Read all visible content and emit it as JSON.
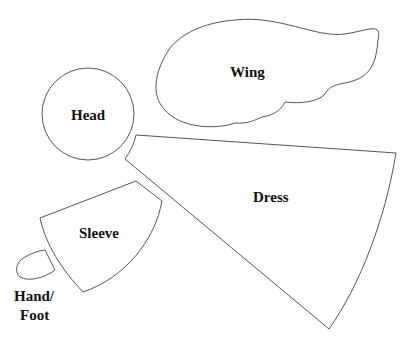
{
  "pieces": {
    "wing": {
      "label": "Wing"
    },
    "head": {
      "label": "Head"
    },
    "dress": {
      "label": "Dress"
    },
    "sleeve": {
      "label": "Sleeve"
    },
    "hand": {
      "label_line1": "Hand/",
      "label_line2": "Foot"
    }
  },
  "colors": {
    "outline": "#555555",
    "text": "#111111",
    "background": "#ffffff"
  }
}
